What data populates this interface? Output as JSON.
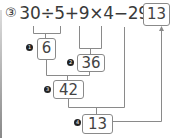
{
  "problem": {
    "number_label": "③",
    "expression": "30÷5+9×4−29=",
    "answer": "13"
  },
  "steps": [
    {
      "marker": "1",
      "value": "6"
    },
    {
      "marker": "2",
      "value": "36"
    },
    {
      "marker": "3",
      "value": "42"
    },
    {
      "marker": "4",
      "value": "13"
    }
  ],
  "colors": {
    "line": "#8a8a8a",
    "text": "#3a3a3a",
    "marker": "#222222"
  }
}
